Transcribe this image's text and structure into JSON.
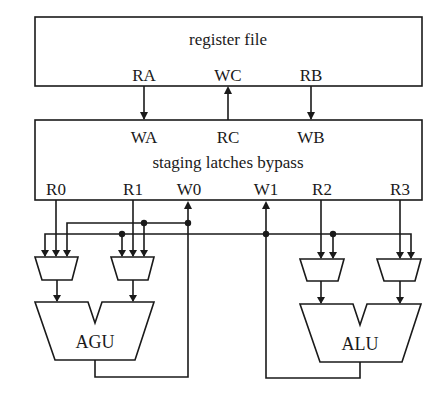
{
  "diagram": {
    "register_file": {
      "title": "register file",
      "ports": [
        "RA",
        "WC",
        "RB"
      ]
    },
    "staging": {
      "title": "staging latches bypass",
      "top_ports": [
        "WA",
        "RC",
        "WB"
      ],
      "bottom_ports": [
        "R0",
        "R1",
        "W0",
        "W1",
        "R2",
        "R3"
      ]
    },
    "units": {
      "agu": "AGU",
      "alu": "ALU"
    },
    "connections": [
      {
        "from": "RA",
        "to": "WA"
      },
      {
        "from": "RC",
        "to": "WC"
      },
      {
        "from": "RB",
        "to": "WB"
      },
      {
        "from": "R0",
        "to": "mux-1"
      },
      {
        "from": "R1",
        "to": "mux-2"
      },
      {
        "from": "R2",
        "to": "mux-3"
      },
      {
        "from": "R3",
        "to": "mux-4"
      },
      {
        "from": "AGU",
        "to": "W0"
      },
      {
        "from": "ALU",
        "to": "W1"
      }
    ],
    "colors": {
      "stroke": "#1a1a1a",
      "background": "#ffffff"
    }
  }
}
